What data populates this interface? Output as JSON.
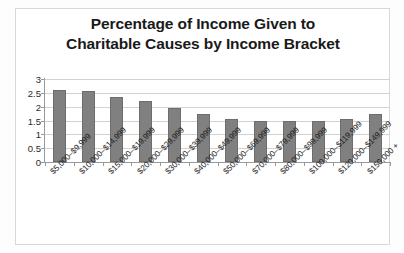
{
  "chart_data": {
    "type": "bar",
    "title": "Percentage of Income Given to Charitable Causes by Income Bracket",
    "title_lines": [
      "Percentage of Income Given to",
      "Charitable Causes by Income Bracket"
    ],
    "xlabel": "",
    "ylabel": "",
    "ylim": [
      0,
      3
    ],
    "ytick_values": [
      0,
      0.5,
      1,
      1.5,
      2,
      2.5,
      3
    ],
    "ytick_labels": [
      "0",
      "0.5",
      "1",
      "1.5",
      "2",
      "2.5",
      "3"
    ],
    "grid": true,
    "legend": false,
    "bar_color": "#808080",
    "categories": [
      "$5,000–$9,999",
      "$10,000–$14,999",
      "$15,000–$19,999",
      "$20,000–$29,999",
      "$30,000–$39,999",
      "$40,000–$49,999",
      "$50,000–$69,999",
      "$70,000–$79,999",
      "$80,000–$99,999",
      "$100,000–$119,999",
      "$120,000–$149,999",
      "$150,000 +"
    ],
    "values": [
      2.6,
      2.55,
      2.35,
      2.2,
      1.95,
      1.75,
      1.55,
      1.5,
      1.5,
      1.5,
      1.55,
      1.75
    ]
  }
}
